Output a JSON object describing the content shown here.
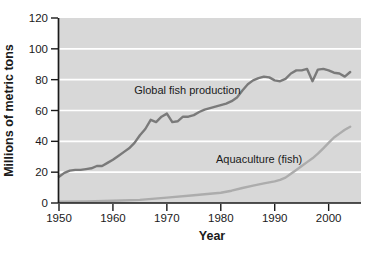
{
  "colors": {
    "page_bg": "#ffffff",
    "plot_bg": "#d8d8d8",
    "gridline": "#ffffff",
    "axis": "#1a1a1a",
    "text": "#1a1a1a",
    "global_line": "#7a7a7a",
    "aquaculture_line": "#acacac"
  },
  "chart_data": {
    "type": "line",
    "title": "",
    "xlabel": "Year",
    "ylabel": "Millions of metric tons",
    "xlim": [
      1950,
      2006
    ],
    "ylim": [
      0,
      120
    ],
    "x_ticks": [
      1950,
      1960,
      1970,
      1980,
      1990,
      2000
    ],
    "y_ticks": [
      0,
      20,
      40,
      60,
      80,
      100,
      120
    ],
    "grid": "horizontal-white-on-gray",
    "legend_position": "inline-annotations",
    "series": [
      {
        "name": "Global fish production",
        "color": "#7a7a7a",
        "width": 2.4,
        "x": [
          1950,
          1951,
          1952,
          1953,
          1954,
          1955,
          1956,
          1957,
          1958,
          1959,
          1960,
          1961,
          1962,
          1963,
          1964,
          1965,
          1966,
          1967,
          1968,
          1969,
          1970,
          1971,
          1972,
          1973,
          1974,
          1975,
          1976,
          1977,
          1978,
          1979,
          1980,
          1981,
          1982,
          1983,
          1984,
          1985,
          1986,
          1987,
          1988,
          1989,
          1990,
          1991,
          1992,
          1993,
          1994,
          1995,
          1996,
          1997,
          1998,
          1999,
          2000,
          2001,
          2002,
          2003,
          2004
        ],
        "values": [
          17,
          19.5,
          21,
          21.5,
          21.5,
          22,
          22.5,
          24,
          24,
          26,
          28,
          30.5,
          33,
          35.5,
          39,
          44,
          48,
          54,
          52.5,
          56,
          58,
          52.5,
          53,
          56,
          56,
          57,
          59,
          60.5,
          61.5,
          62.5,
          63.5,
          64.5,
          66,
          68.5,
          73,
          77,
          79.5,
          81,
          82,
          81.5,
          79.5,
          79,
          80.5,
          84,
          86,
          86,
          87,
          79,
          86.5,
          87,
          86,
          84.5,
          84,
          82,
          85
        ]
      },
      {
        "name": "Aquaculture (fish)",
        "color": "#acacac",
        "width": 2.4,
        "x": [
          1950,
          1955,
          1960,
          1965,
          1970,
          1975,
          1978,
          1980,
          1982,
          1984,
          1986,
          1988,
          1990,
          1991,
          1992,
          1993,
          1994,
          1995,
          1996,
          1997,
          1998,
          1999,
          2000,
          2001,
          2002,
          2003,
          2004
        ],
        "values": [
          0.8,
          1,
          1.4,
          2,
          3.5,
          5,
          6,
          6.7,
          8,
          9.7,
          11.2,
          12.7,
          14,
          15,
          16.5,
          19,
          21.5,
          24,
          26.5,
          29,
          32,
          35.5,
          39,
          42.5,
          45,
          47.5,
          49.5
        ]
      }
    ],
    "annotations": [
      {
        "text": "Global fish production",
        "x": 1973.8,
        "y": 73.3
      },
      {
        "text": "Aquaculture (fish)",
        "x": 1987.1,
        "y": 28.5
      }
    ]
  }
}
